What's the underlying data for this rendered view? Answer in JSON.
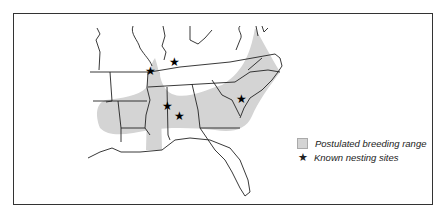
{
  "map": {
    "region": "Southeastern United States",
    "range_color": "#d4d4d4",
    "line_color": "#222222",
    "nesting_sites": [
      {
        "x": 151,
        "y": 71
      },
      {
        "x": 175,
        "y": 62
      },
      {
        "x": 168,
        "y": 106
      },
      {
        "x": 180,
        "y": 116
      },
      {
        "x": 242,
        "y": 99
      }
    ]
  },
  "legend": {
    "items": [
      {
        "icon": "gray-square",
        "label": "Postulated breeding range"
      },
      {
        "icon": "star-icon",
        "label": "Known nesting sites",
        "glyph": "★"
      }
    ]
  }
}
